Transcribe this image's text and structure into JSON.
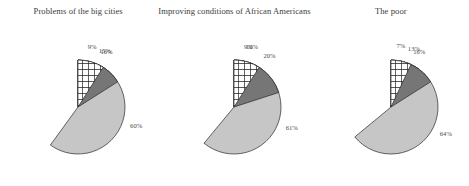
{
  "chart_data": [
    {
      "type": "pie",
      "title": "Problems of the big cities",
      "categories": [
        "Too much",
        "About right",
        "Too little",
        "Don't know"
      ],
      "values": [
        15,
        60,
        16,
        9
      ],
      "labels": [
        "15%",
        "60%",
        "16%",
        "9%"
      ],
      "colors": [
        "#1a1a1a",
        "#c6c6c6",
        "#767676",
        "crosshatch"
      ],
      "legend": "none",
      "grid": false
    },
    {
      "type": "pie",
      "title": "Improving conditions of African Americans",
      "categories": [
        "Too much",
        "About right",
        "Too little",
        "Don't know"
      ],
      "values": [
        10,
        61,
        20,
        9
      ],
      "labels": [
        "10%",
        "61%",
        "20%",
        "9%"
      ],
      "colors": [
        "#1a1a1a",
        "#c6c6c6",
        "#767676",
        "crosshatch"
      ],
      "legend": "none",
      "grid": false
    },
    {
      "type": "pie",
      "title": "The poor",
      "categories": [
        "Too much",
        "About right",
        "Too little",
        "Don't know"
      ],
      "values": [
        13,
        64,
        16,
        7
      ],
      "labels": [
        "13%",
        "64%",
        "16%",
        "7%"
      ],
      "colors": [
        "#1a1a1a",
        "#c6c6c6",
        "#767676",
        "crosshatch"
      ],
      "legend": "none",
      "grid": false
    }
  ],
  "panels": [
    {
      "title": "Problems of the big cities",
      "slices": [
        {
          "label": "15%",
          "value": 15,
          "fill": "#1a1a1a"
        },
        {
          "label": "60%",
          "value": 60,
          "fill": "#c6c6c6"
        },
        {
          "label": "16%",
          "value": 16,
          "fill": "#767676"
        },
        {
          "label": "9%",
          "value": 9,
          "fill": "crosshatch"
        }
      ]
    },
    {
      "title": "Improving conditions of African Americans",
      "slices": [
        {
          "label": "10%",
          "value": 10,
          "fill": "#1a1a1a"
        },
        {
          "label": "61%",
          "value": 61,
          "fill": "#c6c6c6"
        },
        {
          "label": "20%",
          "value": 20,
          "fill": "#767676"
        },
        {
          "label": "9%",
          "value": 9,
          "fill": "crosshatch"
        }
      ]
    },
    {
      "title": "The poor",
      "slices": [
        {
          "label": "13%",
          "value": 13,
          "fill": "#1a1a1a"
        },
        {
          "label": "64%",
          "value": 64,
          "fill": "#c6c6c6"
        },
        {
          "label": "16%",
          "value": 16,
          "fill": "#767676"
        },
        {
          "label": "7%",
          "value": 7,
          "fill": "crosshatch"
        }
      ]
    }
  ]
}
